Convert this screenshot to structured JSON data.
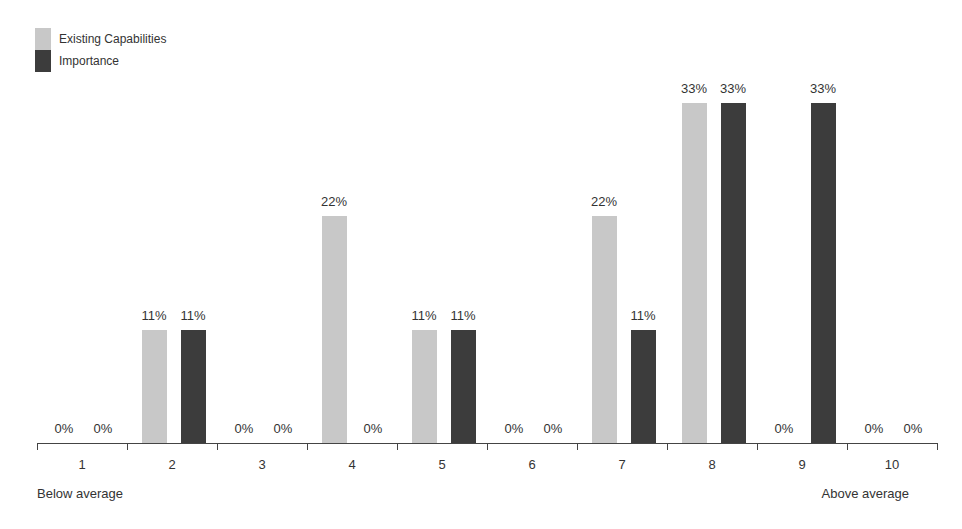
{
  "chart_data": {
    "type": "bar",
    "title": "",
    "xlabel": "",
    "ylabel": "",
    "categories": [
      "1",
      "2",
      "3",
      "4",
      "5",
      "6",
      "7",
      "8",
      "9",
      "10"
    ],
    "series": [
      {
        "name": "Existing Capabilities",
        "color": "#c8c8c8",
        "values": [
          0,
          11,
          0,
          22,
          11,
          0,
          22,
          33,
          0,
          0
        ]
      },
      {
        "name": "Importance",
        "color": "#3c3c3c",
        "values": [
          0,
          11,
          0,
          0,
          11,
          0,
          11,
          33,
          33,
          0
        ]
      }
    ],
    "value_labels": {
      "existing": [
        "0%",
        "11%",
        "0%",
        "22%",
        "11%",
        "0%",
        "22%",
        "33%",
        "0%",
        "0%"
      ],
      "importance": [
        "0%",
        "11%",
        "0%",
        "0%",
        "11%",
        "0%",
        "11%",
        "33%",
        "33%",
        "0%"
      ]
    },
    "ylim": [
      0,
      33
    ],
    "grid": false,
    "legend_position": "top-left",
    "axis_annotations": {
      "left": "Below average",
      "right": "Above average"
    }
  }
}
